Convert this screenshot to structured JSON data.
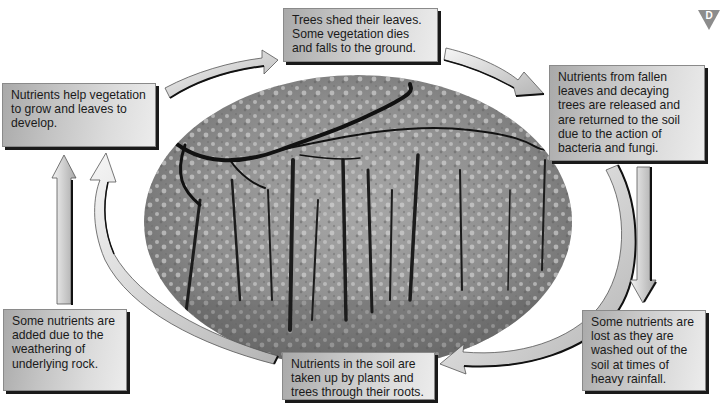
{
  "diagram": {
    "badge": {
      "letter": "D",
      "color": "#8c8c8c"
    },
    "center_image": {
      "description": "Black-and-white photograph of a deciduous woodland in an oval frame"
    },
    "boxes": {
      "top": "Trees shed their leaves. Some vegetation dies and falls to the ground.",
      "right": "Nutrients from fallen leaves and decaying trees are released and are returned to the soil due to the action of bacteria and fungi.",
      "bottom_right": "Some nutrients are lost as they are washed out of the soil at times of heavy rainfall.",
      "bottom_center": "Nutrients in the soil are taken up by plants and trees through their roots.",
      "bottom_left": "Some nutrients are added due to the weathering of underlying rock.",
      "left": "Nutrients help vegetation to grow and leaves to develop."
    },
    "cycle_order": [
      "top",
      "right",
      "bottom_center",
      "left"
    ],
    "side_flows": [
      {
        "from": "right",
        "to": "bottom_right",
        "direction": "down",
        "meaning": "loss by leaching"
      },
      {
        "from": "bottom_left",
        "to": "left",
        "direction": "up",
        "meaning": "gain from weathering"
      }
    ],
    "colors": {
      "box_dark": "#a9a9a9",
      "box_light": "#ececec",
      "box_shadow": "#1a1a1a",
      "arrow_fill_light": "#f4f4f4",
      "arrow_fill_dark": "#b8b8b8"
    }
  }
}
